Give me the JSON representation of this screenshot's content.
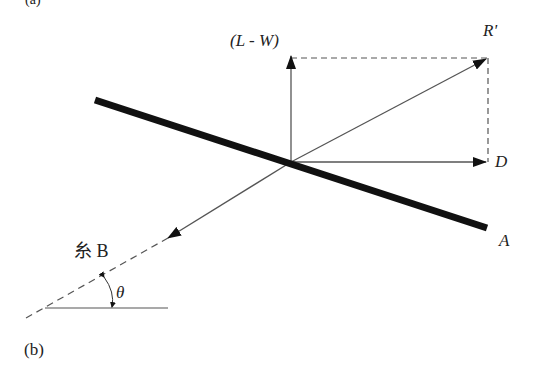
{
  "diagram": {
    "panel_label": "(b)",
    "top_fragment": "(a)",
    "labels": {
      "lift_minus_weight": "(L - W)",
      "resultant": "R'",
      "drag": "D",
      "plate": "A",
      "string": "糸 B",
      "angle": "θ"
    },
    "colors": {
      "line": "#555555",
      "plate": "#111111",
      "text": "#222222"
    }
  }
}
